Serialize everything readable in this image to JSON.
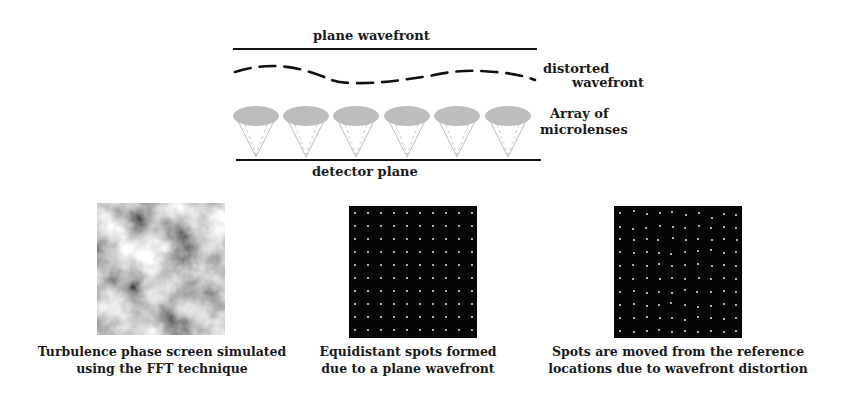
{
  "diagram": {
    "top": {
      "plane_wavefront_label": "plane wavefront",
      "distorted_wavefront_label_line1": "distorted",
      "distorted_wavefront_label_line2": "wavefront",
      "microlens_label_line1": "Array of",
      "microlens_label_line2": "microlenses",
      "detector_plane_label": "detector plane",
      "microlens_count": 6
    },
    "panels": [
      {
        "name": "turbulence-phase-screen",
        "caption_line1": "Turbulence phase screen simulated",
        "caption_line2": "using the FFT technique"
      },
      {
        "name": "equidistant-spots",
        "caption_line1": "Equidistant spots formed",
        "caption_line2": "due to a plane wavefront",
        "grid": "10x10"
      },
      {
        "name": "displaced-spots",
        "caption_line1": "Spots are moved from the reference",
        "caption_line2": "locations due to wavefront distortion",
        "grid": "10x10"
      }
    ],
    "colors": {
      "line": "#111111",
      "lens_fill": "#bdbdbd",
      "spot_background": "#050505",
      "spot": "#d8d8d8"
    }
  }
}
